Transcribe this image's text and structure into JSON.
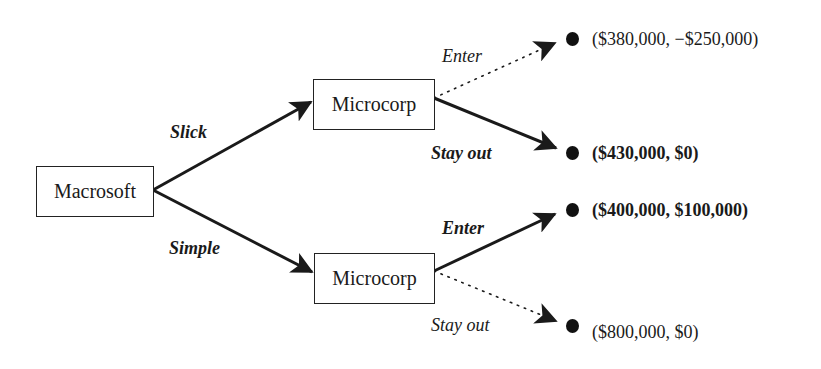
{
  "diagram": {
    "type": "game-tree",
    "nodes": {
      "root": {
        "label": "Macrosoft"
      },
      "upper": {
        "label": "Microcorp"
      },
      "lower": {
        "label": "Microcorp"
      }
    },
    "branches": {
      "root_upper": {
        "label": "Slick",
        "style": "solid",
        "emphasis": "bold"
      },
      "root_lower": {
        "label": "Simple",
        "style": "solid",
        "emphasis": "bold"
      },
      "upper_enter": {
        "label": "Enter",
        "style": "dotted",
        "emphasis": "normal"
      },
      "upper_stay": {
        "label": "Stay out",
        "style": "solid",
        "emphasis": "bold"
      },
      "lower_enter": {
        "label": "Enter",
        "style": "solid",
        "emphasis": "bold"
      },
      "lower_stay": {
        "label": "Stay out",
        "style": "dotted",
        "emphasis": "normal"
      }
    },
    "payoffs": [
      {
        "text": "($380,000, −$250,000)",
        "bold": false
      },
      {
        "text": "($430,000, $0)",
        "bold": true
      },
      {
        "text": "($400,000, $100,000)",
        "bold": true
      },
      {
        "text": "($800,000, $0)",
        "bold": false
      }
    ],
    "colors": {
      "line": "#1a1a1a",
      "dot": "#111111",
      "background": "#ffffff"
    }
  }
}
